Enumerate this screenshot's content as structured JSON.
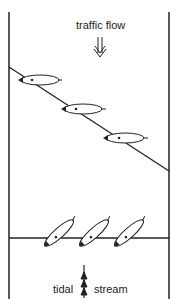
{
  "diagram": {
    "top_label": "traffic flow",
    "bottom_label_left": "tidal",
    "bottom_label_right": "stream",
    "colors": {
      "line": "#222222",
      "background": "#ffffff"
    },
    "icons": {
      "traffic_arrow": "double-arrow-down",
      "tidal_arrow": "triple-arrow-up",
      "boat": "sailboat-hull"
    },
    "boats_upper_count": 3,
    "boats_lower_count": 3
  }
}
